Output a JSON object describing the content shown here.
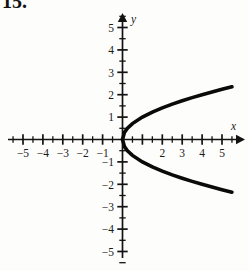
{
  "problem": {
    "number": "15."
  },
  "axes": {
    "x_name": "x",
    "y_name": "y",
    "x_labels_negative": [
      "-5",
      "-4",
      "-3",
      "-2",
      "-1"
    ],
    "x_labels_positive": [
      "2",
      "3",
      "4",
      "5"
    ],
    "y_labels_positive": [
      "5",
      "4",
      "3",
      "2",
      "1"
    ],
    "y_labels_negative": [
      "-1",
      "-2",
      "-3",
      "-4",
      "-5"
    ]
  },
  "chart_data": {
    "type": "line",
    "title": "",
    "subtitle": "",
    "xlabel": "x",
    "ylabel": "y",
    "xlim": [
      -5.6,
      5.7
    ],
    "ylim": [
      -5.6,
      5.6
    ],
    "grid": false,
    "legend": null,
    "x_ticks": [
      -5,
      -4,
      -3,
      -2,
      -1,
      0,
      1,
      2,
      3,
      4,
      5
    ],
    "y_ticks": [
      -5,
      -4,
      -3,
      -2,
      -1,
      0,
      1,
      2,
      3,
      4,
      5
    ],
    "x_tick_labels": [
      "-5",
      "-4",
      "-3",
      "-2",
      "-1",
      "",
      "",
      "2",
      "3",
      "4",
      "5"
    ],
    "y_tick_labels": [
      "-5",
      "-4",
      "-3",
      "-2",
      "-1",
      "",
      "1",
      "2",
      "3",
      "4",
      "5"
    ],
    "minor_tick_step": 0.5,
    "equation": "y^2 = x",
    "series": [
      {
        "name": "upper branch y = sqrt(x)",
        "x": [
          0,
          0.1,
          0.25,
          0.5,
          1,
          1.5,
          2,
          2.5,
          3,
          3.5,
          4,
          4.5,
          5,
          5.5
        ],
        "values": [
          0,
          0.32,
          0.5,
          0.71,
          1,
          1.22,
          1.41,
          1.58,
          1.73,
          1.87,
          2,
          2.12,
          2.24,
          2.35
        ]
      },
      {
        "name": "lower branch y = -sqrt(x)",
        "x": [
          0,
          0.1,
          0.25,
          0.5,
          1,
          1.5,
          2,
          2.5,
          3,
          3.5,
          4,
          4.5,
          5,
          5.5
        ],
        "values": [
          0,
          -0.32,
          -0.5,
          -0.71,
          -1,
          -1.22,
          -1.41,
          -1.58,
          -1.73,
          -1.87,
          -2,
          -2.12,
          -2.24,
          -2.35
        ]
      }
    ]
  }
}
